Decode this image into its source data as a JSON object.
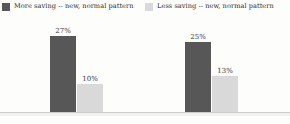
{
  "chart_data": {
    "type": "bar",
    "title": "",
    "subtitle": "",
    "xlabel": "",
    "ylabel": "",
    "ylim": [
      0,
      30
    ],
    "grid": false,
    "legend_position": "top",
    "categories": [
      "",
      ""
    ],
    "series": [
      {
        "name": "More saving -- new, normal pattern",
        "color": "#575757",
        "values": [
          27,
          25
        ],
        "labels": [
          "27%",
          "10%"
        ]
      },
      {
        "name": "Less saving -- new, normal pattern",
        "color": "#d9d9d9",
        "values": [
          10,
          13
        ],
        "labels": [
          "25%",
          "13%"
        ]
      }
    ],
    "bar_labels": [
      [
        "27%",
        "10%"
      ],
      [
        "25%",
        "13%"
      ]
    ]
  },
  "legend": {
    "entries": [
      {
        "label": "More saving -- new, normal pattern",
        "color": "#575757"
      },
      {
        "label": "Less saving -- new, normal pattern",
        "color": "#d9d9d9"
      }
    ]
  },
  "groups": [
    {
      "category": "",
      "bars": [
        {
          "series": "More saving -- new, normal pattern",
          "value": 27,
          "label": "27%",
          "color": "#575757"
        },
        {
          "series": "Less saving -- new, normal pattern",
          "value": 10,
          "label": "10%",
          "color": "#d9d9d9"
        }
      ]
    },
    {
      "category": "",
      "bars": [
        {
          "series": "More saving -- new, normal pattern",
          "value": 25,
          "label": "25%",
          "color": "#575757"
        },
        {
          "series": "Less saving -- new, normal pattern",
          "value": 13,
          "label": "13%",
          "color": "#d9d9d9"
        }
      ]
    }
  ],
  "colors": {
    "background": "#fdfdfc",
    "axis_line": "#c9c9c5",
    "dark_series": "#575757",
    "light_series": "#d9d9d9",
    "label_text": "#3a3a3a"
  }
}
